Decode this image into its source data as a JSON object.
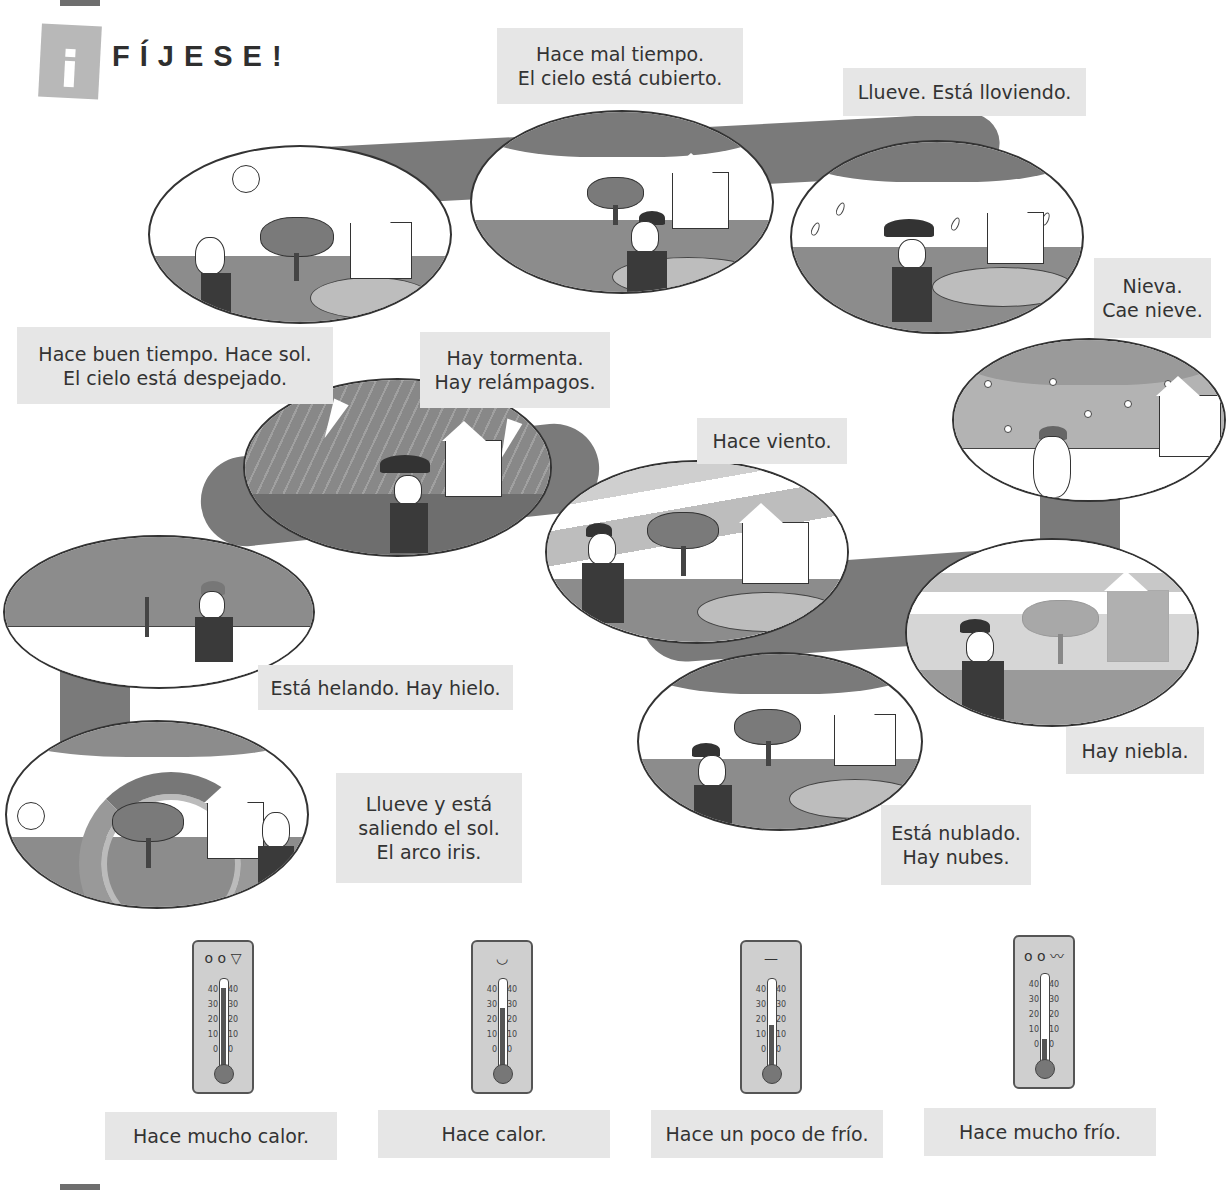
{
  "page": {
    "section_badge_icon": "info-i-icon",
    "title": "FÍJESE!"
  },
  "weather_scenes": [
    {
      "id": "sunny",
      "lines": [
        "Hace buen tiempo. Hace sol.",
        "El cielo está despejado."
      ]
    },
    {
      "id": "overcast",
      "lines": [
        "Hace mal tiempo.",
        "El cielo está cubierto."
      ]
    },
    {
      "id": "rain",
      "lines": [
        "Llueve. Está lloviendo."
      ]
    },
    {
      "id": "snow",
      "lines": [
        "Nieva.",
        "Cae nieve."
      ]
    },
    {
      "id": "storm",
      "lines": [
        "Hay tormenta.",
        "Hay relámpagos."
      ]
    },
    {
      "id": "wind",
      "lines": [
        "Hace viento."
      ]
    },
    {
      "id": "ice",
      "lines": [
        "Está helando. Hay hielo."
      ]
    },
    {
      "id": "fog",
      "lines": [
        "Hay niebla."
      ]
    },
    {
      "id": "rainbow",
      "lines": [
        "Llueve y está",
        "saliendo el sol.",
        "El arco iris."
      ]
    },
    {
      "id": "cloudy",
      "lines": [
        "Está nublado.",
        "Hay nubes."
      ]
    }
  ],
  "thermometers": [
    {
      "label": "Hace mucho calor.",
      "face": "o o  ▽",
      "level": 84
    },
    {
      "label": "Hace calor.",
      "face": "◡",
      "level": 60
    },
    {
      "label": "Hace un poco de frío.",
      "face": "—",
      "level": 40
    },
    {
      "label": "Hace mucho frío.",
      "face": "o o  〰",
      "level": 18
    }
  ],
  "thermometer_scale": [
    "40",
    "30",
    "20",
    "10",
    "0"
  ]
}
